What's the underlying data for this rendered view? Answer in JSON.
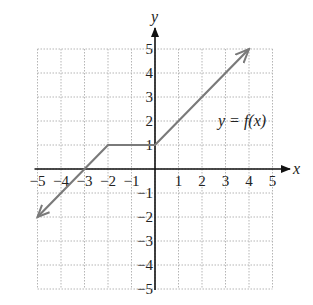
{
  "chart_data": {
    "type": "line",
    "title": "",
    "xlabel": "x",
    "ylabel": "y",
    "xlim": [
      -5,
      5
    ],
    "ylim": [
      -5,
      5
    ],
    "grid": true,
    "grid_style": "dotted",
    "x_ticks": [
      "−5",
      "−4",
      "−3",
      "−2",
      "−1",
      "1",
      "2",
      "3",
      "4",
      "5"
    ],
    "y_ticks": [
      "5",
      "4",
      "3",
      "2",
      "1",
      "−1",
      "−2",
      "−3",
      "−4",
      "−5"
    ],
    "annotation": "y = f(x)",
    "series": [
      {
        "name": "y = f(x)",
        "points": [
          [
            -5,
            -2
          ],
          [
            -2,
            1
          ],
          [
            0,
            1
          ],
          [
            4,
            5
          ]
        ],
        "arrows": [
          "start",
          "end"
        ],
        "color": "#7a7a7a"
      }
    ]
  },
  "labels": {
    "x_axis": "x",
    "y_axis": "y",
    "function": "y = f(x)"
  }
}
